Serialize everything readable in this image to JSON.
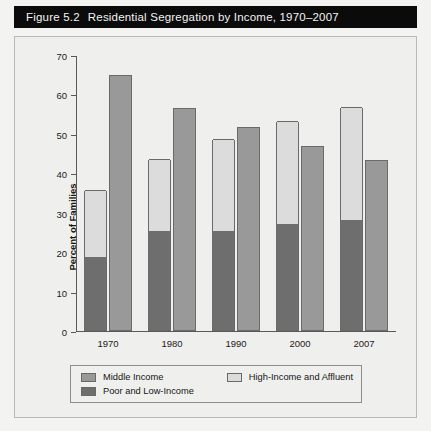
{
  "banner": {
    "figure_number": "Figure 5.2",
    "title": "Residential Segregation by Income, 1970–2007"
  },
  "colors": {
    "poor_low": "#6e6e6e",
    "middle": "#999999",
    "high_affluent": "#dcdcdc",
    "banner_bg": "#0b0b0b",
    "banner_text": "#f3f3f3",
    "panel_bg": "#efefed",
    "axis": "#59595a"
  },
  "legend": {
    "items": [
      {
        "label": "Middle Income",
        "color": "#999999"
      },
      {
        "label": "High-Income and Affluent",
        "color": "#dcdcdc"
      },
      {
        "label": "Poor and Low-Income",
        "color": "#6e6e6e"
      }
    ]
  },
  "chart_data": {
    "type": "bar",
    "title": "Residential Segregation by Income, 1970–2007",
    "xlabel": "",
    "ylabel": "Percent of Families",
    "ylim": [
      0,
      70
    ],
    "ytick_step": 10,
    "yticks": [
      70,
      60,
      50,
      40,
      30,
      20,
      10,
      0
    ],
    "categories": [
      "1970",
      "1980",
      "1990",
      "2000",
      "2007"
    ],
    "grid": false,
    "legend_position": "bottom",
    "bar_layout": "grouped-with-stack",
    "series": [
      {
        "name": "Poor and Low-Income",
        "color": "#6e6e6e",
        "stack": "segregated",
        "values": [
          18.5,
          25.0,
          25.0,
          27.0,
          28.0
        ]
      },
      {
        "name": "High-Income and Affluent",
        "color": "#dcdcdc",
        "stack": "segregated",
        "values": [
          17.0,
          18.5,
          23.5,
          26.0,
          28.5
        ]
      },
      {
        "name": "Middle Income",
        "color": "#999999",
        "stack": null,
        "values": [
          65.0,
          56.5,
          51.8,
          47.0,
          43.5
        ]
      }
    ],
    "stack_totals": [
      35.5,
      43.5,
      48.5,
      53.0,
      56.5
    ]
  }
}
